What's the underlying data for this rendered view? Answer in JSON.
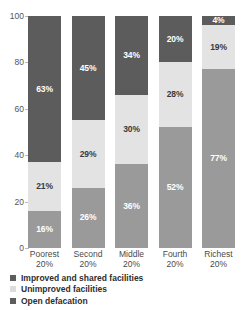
{
  "chart_data": {
    "type": "bar",
    "subtype": "stacked-100-percent",
    "title": "",
    "subtitle": "",
    "xlabel": "",
    "ylabel": "",
    "ylim": [
      0,
      100
    ],
    "yticks": [
      0,
      20,
      40,
      60,
      80,
      100
    ],
    "ytick_labels": [
      "0",
      "20",
      "40",
      "60",
      "80",
      "100"
    ],
    "grid": false,
    "legend_position": "bottom-left",
    "categories": [
      "Poorest 20%",
      "Second 20%",
      "Middle 20%",
      "Fourth 20%",
      "Richest 20%"
    ],
    "category_lines": [
      {
        "line1": "Poorest",
        "line2": "20%"
      },
      {
        "line1": "Second",
        "line2": "20%"
      },
      {
        "line1": "Middle",
        "line2": "20%"
      },
      {
        "line1": "Fourth",
        "line2": "20%"
      },
      {
        "line1": "Richest",
        "line2": "20%"
      }
    ],
    "series": [
      {
        "name": "Improved and shared facilities",
        "color": "#5c5c5c",
        "values": [
          63,
          45,
          34,
          20,
          4
        ],
        "labels": [
          "63%",
          "45%",
          "34%",
          "20%",
          "4%"
        ]
      },
      {
        "name": "Unimproved facilities",
        "color": "#e3e3e3",
        "values": [
          21,
          29,
          30,
          28,
          19
        ],
        "labels": [
          "21%",
          "29%",
          "30%",
          "28%",
          "19%"
        ]
      },
      {
        "name": "Open defacation",
        "color": "#9a9a9a",
        "values": [
          16,
          26,
          36,
          52,
          77
        ],
        "labels": [
          "16%",
          "26%",
          "36%",
          "52%",
          "77%"
        ]
      }
    ],
    "stack_order_top_to_bottom": [
      "Improved and shared facilities",
      "Unimproved facilities",
      "Open defacation"
    ]
  },
  "legend": {
    "items": [
      {
        "label": "Improved and shared facilities",
        "color": "#5c5c5c"
      },
      {
        "label": "Unimproved facilities",
        "color": "#dcdcdc"
      },
      {
        "label": "Open defacation",
        "color": "#5c5c5c"
      }
    ]
  }
}
